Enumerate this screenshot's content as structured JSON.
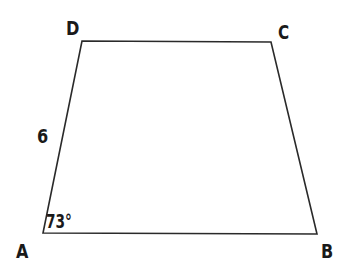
{
  "diagram": {
    "type": "trapezoid",
    "colors": {
      "stroke": "#2a2a2a",
      "text": "#1a1a1a",
      "background": "#ffffff"
    },
    "vertices": {
      "A": {
        "label": "A",
        "x": 43,
        "y": 233
      },
      "B": {
        "label": "B",
        "x": 317,
        "y": 234
      },
      "C": {
        "label": "C",
        "x": 271,
        "y": 42
      },
      "D": {
        "label": "D",
        "x": 82,
        "y": 41
      }
    },
    "side_labels": {
      "AD": "6"
    },
    "angle_labels": {
      "A": "73°"
    }
  }
}
